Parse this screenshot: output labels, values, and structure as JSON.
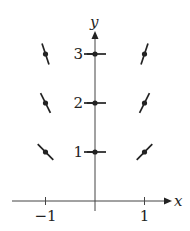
{
  "diagram": {
    "type": "slope-field",
    "axes": {
      "x_label": "x",
      "y_label": "y"
    },
    "x_ticks": [
      {
        "value": -1,
        "label": "−1"
      },
      {
        "value": 1,
        "label": "1"
      }
    ],
    "y_ticks": [
      {
        "value": 1,
        "label": "1"
      },
      {
        "value": 2,
        "label": "2"
      },
      {
        "value": 3,
        "label": "3"
      }
    ],
    "segments": [
      {
        "x": -1,
        "y": 1,
        "slope": -1
      },
      {
        "x": -1,
        "y": 2,
        "slope": -2
      },
      {
        "x": -1,
        "y": 3,
        "slope": -3
      },
      {
        "x": 0,
        "y": 1,
        "slope": 0
      },
      {
        "x": 0,
        "y": 2,
        "slope": 0
      },
      {
        "x": 0,
        "y": 3,
        "slope": 0
      },
      {
        "x": 1,
        "y": 1,
        "slope": 1
      },
      {
        "x": 1,
        "y": 2,
        "slope": 2
      },
      {
        "x": 1,
        "y": 3,
        "slope": 3
      }
    ],
    "color": "#222222"
  }
}
